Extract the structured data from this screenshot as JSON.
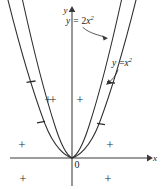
{
  "figure": {
    "background_color": "#ffffff",
    "ink_color": "#2e2e2e",
    "width": 162,
    "height": 189
  },
  "axes": {
    "x_label": "x",
    "y_label": "y",
    "origin_label": "0",
    "origin_px": {
      "x": 72,
      "y": 158
    },
    "x_axis": {
      "start_px": 10,
      "end_px": 150,
      "y_px": 158,
      "has_arrow": true
    },
    "y_axis": {
      "top_px": 8,
      "bottom_px": 186,
      "x_px": 72,
      "has_arrow": true
    }
  },
  "curves": [
    {
      "id": "curve-2x2",
      "equation_lhs": "y",
      "equation_op": "=",
      "equation_rhs_coeff": "2",
      "equation_rhs_base": "x",
      "equation_rhs_exp": "2",
      "label_text": "y = 2x²",
      "a": 2,
      "narrower": true
    },
    {
      "id": "curve-x2",
      "equation_lhs": "y",
      "equation_op": "=",
      "equation_rhs_coeff": "",
      "equation_rhs_base": "x",
      "equation_rhs_exp": "2",
      "label_text": "y = x²",
      "a": 1,
      "narrower": false
    }
  ],
  "labels": {
    "label_2x2": {
      "text": "y = 2x²",
      "x_px": 70,
      "y_px": 20,
      "leader_from": {
        "x": 78,
        "y": 26
      },
      "leader_to": {
        "x": 108,
        "y": 37
      }
    },
    "label_x2": {
      "text": "y = x²",
      "x_px": 112,
      "y_px": 62,
      "leader_from": {
        "x": 118,
        "y": 68
      },
      "leader_to": {
        "x": 106,
        "y": 84
      }
    }
  },
  "region_signs": {
    "plus_symbol": "+",
    "minus_symbol": "−",
    "plus_marks": [
      {
        "id": "plus-inner-left",
        "x_px": 52,
        "y_px": 99
      },
      {
        "id": "plus-inner-right",
        "x_px": 80,
        "y_px": 99
      },
      {
        "id": "plus-outer-left",
        "x_px": 22,
        "y_px": 97
      },
      {
        "id": "plus-lower-left-above-axis",
        "x_px": 22,
        "y_px": 144
      },
      {
        "id": "plus-lower-right-above-axis",
        "x_px": 110,
        "y_px": 144
      },
      {
        "id": "plus-lower-left-below-axis",
        "x_px": 23,
        "y_px": 178
      },
      {
        "id": "plus-lower-right-below-axis",
        "x_px": 108,
        "y_px": 178
      }
    ],
    "minus_marks": [
      {
        "id": "minus-left-upper",
        "x_px": 31,
        "y_px": 81,
        "length": 9,
        "angle_deg": -8
      },
      {
        "id": "minus-left-lower",
        "x_px": 41,
        "y_px": 122,
        "length": 8,
        "angle_deg": -6
      },
      {
        "id": "minus-right-upper",
        "x_px": 111,
        "y_px": 83,
        "length": 8,
        "angle_deg": 6
      },
      {
        "id": "minus-right-lower",
        "x_px": 101,
        "y_px": 124,
        "length": 8,
        "angle_deg": 6
      }
    ]
  }
}
